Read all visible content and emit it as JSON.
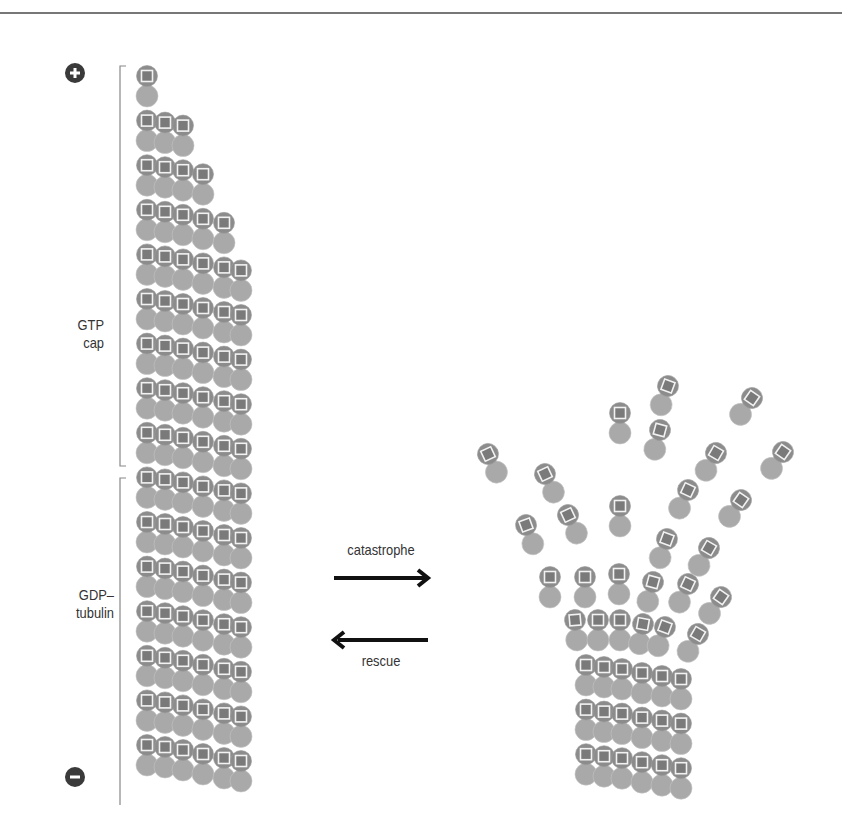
{
  "figure": {
    "left_microtubule": {
      "plus_end_symbol": "+",
      "minus_end_symbol": "−",
      "labels": {
        "gtp_cap_line1": "GTP",
        "gtp_cap_line2": "cap",
        "gdp_line1": "GDP–",
        "gdp_line2": "tubulin"
      }
    },
    "transitions": {
      "forward_label": "catastrophe",
      "reverse_label": "rescue"
    },
    "colors": {
      "alpha_tubulin": "#a9a9a9",
      "beta_tubulin_gtp": "#8c8c8c",
      "gtp_square_fill": "#7a7a7a",
      "gtp_square_stroke": "#f0f0f0",
      "end_marker": "#3a3a3a",
      "arrow": "#111111",
      "bracket": "#888888",
      "rule": "#777777"
    }
  }
}
